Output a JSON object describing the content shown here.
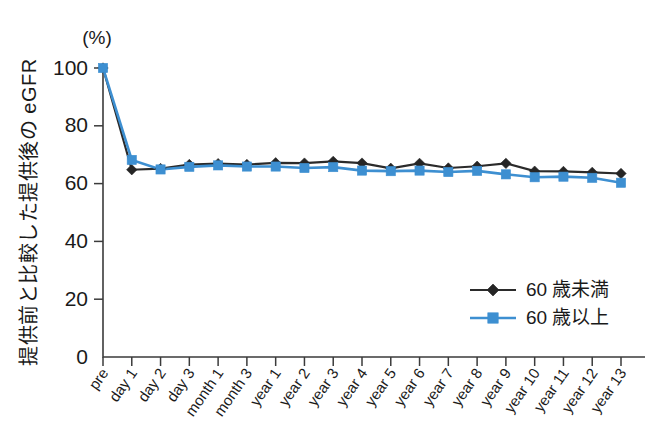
{
  "figure": {
    "unit_label": "(%)",
    "y_axis_title": "提供前と比較した提供後の eGFR"
  },
  "legend": {
    "position": "inside-bottom-right",
    "entries": [
      {
        "label": "60 歳未満",
        "color": "#252525",
        "marker": "diamond"
      },
      {
        "label": "60 歳以上",
        "color": "#3d8fd1",
        "marker": "square"
      }
    ]
  },
  "chart_data": {
    "type": "line",
    "title": "",
    "xlabel": "",
    "ylabel": "提供前と比較した提供後の eGFR",
    "yunit": "(%)",
    "ylim": [
      0,
      100
    ],
    "yticks": [
      0,
      20,
      40,
      60,
      80,
      100
    ],
    "ytick_labels": [
      "0",
      "20",
      "40",
      "60",
      "80",
      "100"
    ],
    "grid": false,
    "legend_position": "lower right",
    "categories": [
      "pre",
      "day 1",
      "day 2",
      "day 3",
      "month 1",
      "month 3",
      "year 1",
      "year 2",
      "year 3",
      "year 4",
      "year 5",
      "year 6",
      "year 7",
      "year 8",
      "year 9",
      "year 10",
      "year 11",
      "year 12",
      "year 13"
    ],
    "series": [
      {
        "name": "60 歳未満",
        "color": "#252525",
        "marker": "diamond",
        "values": [
          100,
          64.8,
          65.2,
          66.6,
          66.9,
          66.6,
          67.2,
          67.1,
          67.7,
          67.1,
          65.3,
          67.0,
          65.4,
          66.0,
          67.0,
          64.3,
          64.2,
          63.9,
          63.5
        ]
      },
      {
        "name": "60 歳以上",
        "color": "#3d8fd1",
        "marker": "square",
        "values": [
          100,
          68.2,
          64.9,
          65.8,
          66.3,
          65.9,
          65.9,
          65.4,
          65.7,
          64.5,
          64.3,
          64.5,
          64.0,
          64.4,
          63.2,
          62.2,
          62.4,
          62.0,
          60.3
        ]
      }
    ]
  }
}
